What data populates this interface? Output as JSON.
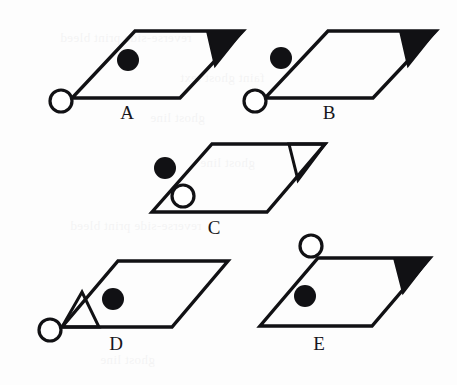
{
  "sheet": {
    "width": 457,
    "height": 385,
    "background_color": "#fdfdfd",
    "ink_color": "#111114",
    "open_marker_fill": "#ffffff",
    "description": "Five lettered answer options, each a parallelogram with a corner triangle and two circular markers"
  },
  "bleed_through_text": [
    {
      "text": "reverse-side print bleed",
      "x": 60,
      "y": 30
    },
    {
      "text": "faint ghost text",
      "x": 180,
      "y": 70
    },
    {
      "text": "ghost line",
      "x": 150,
      "y": 110
    },
    {
      "text": "ghost line",
      "x": 200,
      "y": 155
    },
    {
      "text": "reverse-side print bleed",
      "x": 70,
      "y": 218
    },
    {
      "text": "ghost line",
      "x": 100,
      "y": 352
    }
  ],
  "options": [
    {
      "id": "a",
      "label": "A",
      "label_x": 113,
      "label_y": 103,
      "parallelogram": {
        "top_left": [
          135,
          31
        ],
        "top_right": [
          243,
          31
        ],
        "bottom_right": [
          180,
          98
        ],
        "bottom_left": [
          72,
          98
        ]
      },
      "corner_triangle": {
        "corner": "top-right",
        "fill": "filled",
        "fill_color": "#111114",
        "points": [
          [
            207,
            31
          ],
          [
            243,
            31
          ],
          [
            215,
            66
          ]
        ]
      },
      "filled_dot": {
        "cx": 128,
        "cy": 60,
        "r": 11,
        "position": "inside"
      },
      "open_circle": {
        "cx": 61,
        "cy": 101,
        "r": 11,
        "position": "outside-left"
      }
    },
    {
      "id": "b",
      "label": "B",
      "label_x": 315,
      "label_y": 103,
      "parallelogram": {
        "top_left": [
          328,
          31
        ],
        "top_right": [
          436,
          31
        ],
        "bottom_right": [
          373,
          98
        ],
        "bottom_left": [
          265,
          98
        ]
      },
      "corner_triangle": {
        "corner": "top-right",
        "fill": "filled",
        "fill_color": "#111114",
        "points": [
          [
            400,
            31
          ],
          [
            436,
            31
          ],
          [
            408,
            66
          ]
        ]
      },
      "filled_dot": {
        "cx": 281,
        "cy": 58,
        "r": 11,
        "position": "outside-left"
      },
      "open_circle": {
        "cx": 255,
        "cy": 101,
        "r": 11,
        "position": "outside-left"
      }
    },
    {
      "id": "c",
      "label": "C",
      "label_x": 200,
      "label_y": 218,
      "parallelogram": {
        "top_left": [
          212,
          144
        ],
        "top_right": [
          325,
          144
        ],
        "bottom_right": [
          267,
          212
        ],
        "bottom_left": [
          152,
          212
        ]
      },
      "corner_triangle": {
        "corner": "top-right",
        "fill": "open",
        "fill_color": "#ffffff",
        "points": [
          [
            289,
            144
          ],
          [
            325,
            144
          ],
          [
            298,
            180
          ]
        ]
      },
      "filled_dot": {
        "cx": 165,
        "cy": 168,
        "r": 11,
        "position": "outside-left"
      },
      "open_circle": {
        "cx": 183,
        "cy": 196,
        "r": 11,
        "position": "inside"
      }
    },
    {
      "id": "d",
      "label": "D",
      "label_x": 102,
      "label_y": 334,
      "parallelogram": {
        "top_left": [
          118,
          261
        ],
        "top_right": [
          228,
          261
        ],
        "bottom_right": [
          172,
          327
        ],
        "bottom_left": [
          62,
          327
        ]
      },
      "corner_triangle": {
        "corner": "bottom-left",
        "fill": "open",
        "fill_color": "#ffffff",
        "points": [
          [
            62,
            327
          ],
          [
            99,
            327
          ],
          [
            82,
            292
          ]
        ]
      },
      "filled_dot": {
        "cx": 113,
        "cy": 299,
        "r": 11,
        "position": "inside"
      },
      "open_circle": {
        "cx": 50,
        "cy": 330,
        "r": 11,
        "position": "outside-left"
      }
    },
    {
      "id": "e",
      "label": "E",
      "label_x": 305,
      "label_y": 334,
      "parallelogram": {
        "top_left": [
          318,
          258
        ],
        "top_right": [
          430,
          258
        ],
        "bottom_right": [
          372,
          326
        ],
        "bottom_left": [
          260,
          326
        ]
      },
      "corner_triangle": {
        "corner": "top-right",
        "fill": "filled",
        "fill_color": "#111114",
        "points": [
          [
            394,
            258
          ],
          [
            430,
            258
          ],
          [
            403,
            293
          ]
        ]
      },
      "filled_dot": {
        "cx": 305,
        "cy": 296,
        "r": 11,
        "position": "inside"
      },
      "open_circle": {
        "cx": 311,
        "cy": 246,
        "r": 11,
        "position": "outside-top"
      }
    }
  ]
}
